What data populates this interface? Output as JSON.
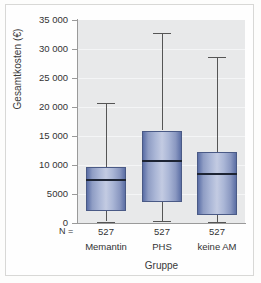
{
  "figure": {
    "y_axis_title": "Gesamtkosten (€)",
    "x_axis_title": "Gruppe",
    "n_prefix": "N ="
  },
  "chart_data": {
    "type": "box",
    "title": "",
    "xlabel": "Gruppe",
    "ylabel": "Gesamtkosten (€)",
    "ylim": [
      0,
      35000
    ],
    "ytick_labels": [
      "35 000",
      "30 000",
      "25 000",
      "20 000",
      "15 000",
      "10 000",
      "5000",
      "0"
    ],
    "ytick_values": [
      35000,
      30000,
      25000,
      20000,
      15000,
      10000,
      5000,
      0
    ],
    "grid": "horizontal",
    "legend": "none",
    "categories": [
      "Memantin",
      "PHS",
      "keine AM"
    ],
    "group_counts": [
      "527",
      "527",
      "527"
    ],
    "boxes": [
      {
        "category": "Memantin",
        "n": "527",
        "whisker_low": 200,
        "q1": 2000,
        "median": 7400,
        "q3": 9600,
        "whisker_high": 20700
      },
      {
        "category": "PHS",
        "n": "527",
        "whisker_low": 400,
        "q1": 3700,
        "median": 10700,
        "q3": 15900,
        "whisker_high": 32700
      },
      {
        "category": "keine AM",
        "n": "527",
        "whisker_low": 100,
        "q1": 1300,
        "median": 8500,
        "q3": 12200,
        "whisker_high": 28700
      }
    ],
    "colors": {
      "box_fill_light": "#c3cbe2",
      "box_fill_dark": "#5a6ea6",
      "box_border": "#4a5a86",
      "median_line": "#1d2433",
      "whisker": "#555555",
      "plot_background": "#e8e9ea",
      "gridline": "#f4f5f6",
      "axis": "#9a9a9a"
    }
  }
}
